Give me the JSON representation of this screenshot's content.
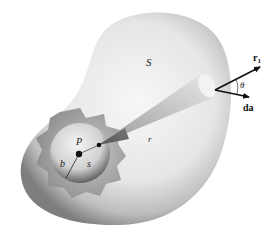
{
  "diagram": {
    "labels": {
      "surface": "S",
      "point": "P",
      "sphere_radius": "b",
      "sphere_surface": "s",
      "distance": "r",
      "unit_vector": "r",
      "unit_vector_sub": "1",
      "angle": "θ",
      "area_element": "da"
    },
    "colors": {
      "background": "#ffffff",
      "surface_light": "#f4f4f4",
      "surface_dark": "#8a8a8a",
      "cutaway": "#a9a9a9",
      "sphere_light": "#f0f0f0",
      "sphere_dark": "#555555",
      "ink": "#111111"
    }
  }
}
